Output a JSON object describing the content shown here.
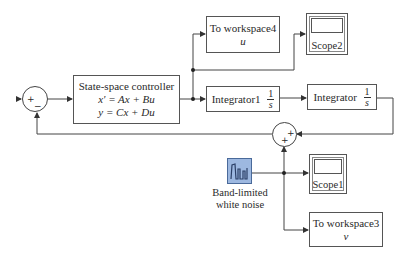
{
  "diagram": {
    "controller": {
      "title": "State-space controller",
      "eq1": "x' = Ax + Bu",
      "eq2": "y = Cx + Du"
    },
    "sum1": {
      "signs": [
        "+",
        "−"
      ]
    },
    "sum2": {
      "signs": [
        "+",
        "+"
      ]
    },
    "to_workspace4": {
      "title": "To workspace4",
      "var": "u"
    },
    "scope2": {
      "label": "Scope2"
    },
    "integrator1": {
      "label": "Integrator1",
      "num": "1",
      "den": "s"
    },
    "integrator": {
      "label": "Integrator",
      "num": "1",
      "den": "s"
    },
    "noise": {
      "label_line1": "Band-limited",
      "label_line2": "white noise",
      "icon": "noise-waveform-icon",
      "color": "#9db8e0"
    },
    "scope1": {
      "label": "Scope1"
    },
    "to_workspace3": {
      "title": "To workspace3",
      "var": "v"
    }
  }
}
